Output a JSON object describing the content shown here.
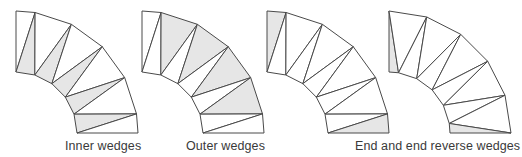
{
  "colors": {
    "stroke": "#4a4a4a",
    "fill": "#e6e6e6",
    "background": "#ffffff",
    "label": "#3a3a3a"
  },
  "geometry": {
    "center_y": 133,
    "inner_radius": 61,
    "outer_radius": 122,
    "stroke_width": 1
  },
  "diagrams": [
    {
      "name": "inner-wedges",
      "label": "Inner wedges",
      "center_x": 16,
      "label_x": 65,
      "pattern": "inner-zigzag",
      "shade": "inner"
    },
    {
      "name": "outer-wedges",
      "label": "Outer wedges",
      "center_x": 142,
      "label_x": 185,
      "pattern": "inner-zigzag",
      "shade": "outer"
    },
    {
      "name": "end-wedges",
      "label": "",
      "center_x": 267,
      "label_x": 0,
      "pattern": "inner-zigzag",
      "shade": "ends"
    },
    {
      "name": "end-reverse-wedges",
      "label": "",
      "center_x": 389,
      "label_x": 0,
      "pattern": "outer-zigzag",
      "shade": "ends"
    }
  ],
  "labels": {
    "inner": "Inner wedges",
    "outer": "Outer wedges",
    "end": "End and end reverse wedges"
  }
}
